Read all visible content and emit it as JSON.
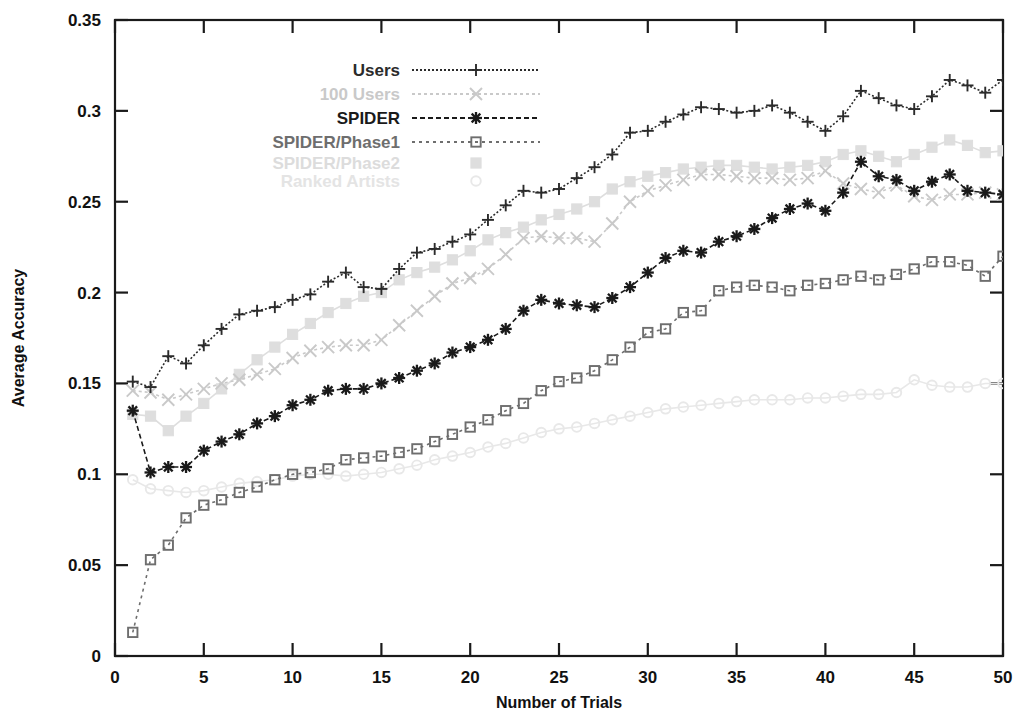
{
  "chart_data": {
    "type": "line",
    "title": "",
    "xlabel": "Number of Trials",
    "ylabel": "Average Accuracy",
    "xlim": [
      0,
      50
    ],
    "ylim": [
      0,
      0.35
    ],
    "xticks": [
      "0",
      "5",
      "10",
      "15",
      "20",
      "25",
      "30",
      "35",
      "40",
      "45",
      "50"
    ],
    "yticks": [
      "0",
      "0.05",
      "0.1",
      "0.15",
      "0.2",
      "0.25",
      "0.3",
      "0.35"
    ],
    "grid": false,
    "legend_position": "top-center",
    "x": [
      1,
      2,
      3,
      4,
      5,
      6,
      7,
      8,
      9,
      10,
      11,
      12,
      13,
      14,
      15,
      16,
      17,
      18,
      19,
      20,
      21,
      22,
      23,
      24,
      25,
      26,
      27,
      28,
      29,
      30,
      31,
      32,
      33,
      34,
      35,
      36,
      37,
      38,
      39,
      40,
      41,
      42,
      43,
      44,
      45,
      46,
      47,
      48,
      49,
      50
    ],
    "series": [
      {
        "name": "Users",
        "color": "#2b2b2b",
        "marker": "plus",
        "dash": "2,2",
        "values": [
          0.151,
          0.148,
          0.165,
          0.161,
          0.171,
          0.18,
          0.188,
          0.19,
          0.192,
          0.196,
          0.199,
          0.206,
          0.211,
          0.203,
          0.202,
          0.213,
          0.222,
          0.224,
          0.228,
          0.232,
          0.24,
          0.248,
          0.256,
          0.255,
          0.257,
          0.263,
          0.269,
          0.276,
          0.288,
          0.289,
          0.294,
          0.298,
          0.302,
          0.301,
          0.299,
          0.3,
          0.303,
          0.299,
          0.294,
          0.289,
          0.297,
          0.311,
          0.307,
          0.303,
          0.301,
          0.308,
          0.317,
          0.314,
          0.31,
          0.317
        ]
      },
      {
        "name": "100 Users",
        "color": "#c9c9c9",
        "marker": "x",
        "dash": "3,3",
        "values": [
          0.146,
          0.145,
          0.141,
          0.144,
          0.147,
          0.15,
          0.152,
          0.155,
          0.158,
          0.164,
          0.168,
          0.17,
          0.171,
          0.171,
          0.174,
          0.182,
          0.19,
          0.198,
          0.205,
          0.208,
          0.213,
          0.221,
          0.23,
          0.231,
          0.23,
          0.23,
          0.228,
          0.238,
          0.25,
          0.256,
          0.259,
          0.262,
          0.265,
          0.265,
          0.264,
          0.263,
          0.263,
          0.262,
          0.263,
          0.267,
          0.26,
          0.257,
          0.255,
          0.259,
          0.253,
          0.251,
          0.254,
          0.254,
          0.255,
          0.254
        ]
      },
      {
        "name": "SPIDER",
        "color": "#1a1a1a",
        "marker": "star",
        "dash": "5,3",
        "values": [
          0.135,
          0.101,
          0.104,
          0.104,
          0.113,
          0.118,
          0.122,
          0.128,
          0.132,
          0.138,
          0.141,
          0.146,
          0.147,
          0.147,
          0.15,
          0.153,
          0.157,
          0.161,
          0.167,
          0.17,
          0.174,
          0.18,
          0.19,
          0.196,
          0.194,
          0.193,
          0.192,
          0.197,
          0.203,
          0.211,
          0.219,
          0.223,
          0.222,
          0.228,
          0.231,
          0.235,
          0.241,
          0.246,
          0.249,
          0.245,
          0.255,
          0.272,
          0.264,
          0.262,
          0.256,
          0.261,
          0.265,
          0.256,
          0.255,
          0.254
        ]
      },
      {
        "name": "SPIDER/Phase1",
        "color": "#6e6e6e",
        "marker": "square",
        "dash": "3,4",
        "values": [
          0.013,
          0.053,
          0.061,
          0.076,
          0.083,
          0.086,
          0.09,
          0.093,
          0.097,
          0.1,
          0.101,
          0.103,
          0.108,
          0.109,
          0.11,
          0.112,
          0.114,
          0.118,
          0.122,
          0.126,
          0.13,
          0.135,
          0.139,
          0.146,
          0.151,
          0.153,
          0.157,
          0.163,
          0.17,
          0.178,
          0.18,
          0.189,
          0.19,
          0.201,
          0.203,
          0.204,
          0.203,
          0.201,
          0.204,
          0.205,
          0.207,
          0.209,
          0.207,
          0.21,
          0.213,
          0.217,
          0.217,
          0.215,
          0.209,
          0.22
        ]
      },
      {
        "name": "SPIDER/Phase2",
        "color": "#dedede",
        "marker": "square-filled",
        "dash": "none",
        "values": [
          0.133,
          0.132,
          0.124,
          0.132,
          0.139,
          0.147,
          0.155,
          0.163,
          0.17,
          0.177,
          0.183,
          0.189,
          0.194,
          0.198,
          0.2,
          0.207,
          0.211,
          0.214,
          0.218,
          0.223,
          0.229,
          0.233,
          0.236,
          0.24,
          0.243,
          0.246,
          0.25,
          0.257,
          0.261,
          0.264,
          0.266,
          0.268,
          0.269,
          0.27,
          0.27,
          0.269,
          0.268,
          0.269,
          0.27,
          0.272,
          0.276,
          0.278,
          0.275,
          0.272,
          0.276,
          0.28,
          0.284,
          0.281,
          0.277,
          0.278
        ]
      },
      {
        "name": "Ranked Artists",
        "color": "#e8e8e8",
        "marker": "circle",
        "dash": "none",
        "values": [
          0.097,
          0.092,
          0.091,
          0.09,
          0.091,
          0.093,
          0.095,
          0.096,
          0.097,
          0.099,
          0.1,
          0.1,
          0.099,
          0.1,
          0.101,
          0.103,
          0.105,
          0.108,
          0.11,
          0.112,
          0.115,
          0.117,
          0.12,
          0.123,
          0.125,
          0.126,
          0.128,
          0.13,
          0.132,
          0.134,
          0.136,
          0.137,
          0.138,
          0.139,
          0.14,
          0.141,
          0.141,
          0.141,
          0.142,
          0.142,
          0.143,
          0.144,
          0.144,
          0.145,
          0.152,
          0.149,
          0.148,
          0.148,
          0.15,
          0.15
        ]
      }
    ]
  }
}
